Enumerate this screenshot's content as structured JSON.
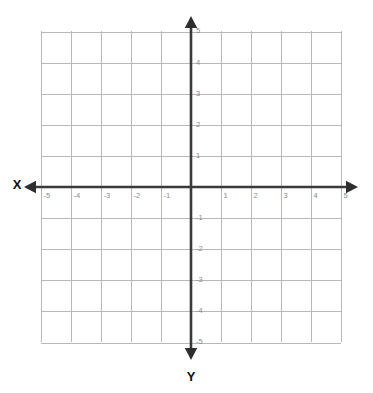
{
  "figure": {
    "kind": "cartesian-coordinate-plane",
    "width": 373,
    "height": 393,
    "background_color": "#ffffff"
  },
  "axis_labels": {
    "x_axis_name": "X",
    "y_axis_name": "Y"
  },
  "colors": {
    "grid": "#b8b8b8",
    "axis": "#3a3a3a",
    "arrow": "#2e2e2e",
    "tick_text": "#8a8a8a",
    "axis_name_text": "#111111"
  },
  "chart_data": {
    "type": "scatter",
    "title": "",
    "subtitle": "",
    "xlabel": "X",
    "ylabel": "Y",
    "xlim": [
      -5,
      5
    ],
    "ylim": [
      -5,
      5
    ],
    "grid": true,
    "grid_step": 1,
    "legend": null,
    "legend_position": "none",
    "origin_label_shown": false,
    "x_ticks": [
      -5,
      -4,
      -3,
      -2,
      -1,
      1,
      2,
      3,
      4,
      5
    ],
    "y_ticks": [
      -5,
      -4,
      -3,
      -2,
      -1,
      1,
      2,
      3,
      4,
      5
    ],
    "x_tick_labels": [
      "-5",
      "-4",
      "-3",
      "-2",
      "-1",
      "1",
      "2",
      "3",
      "4",
      "5"
    ],
    "y_tick_labels": [
      "-5",
      "-4",
      "-3",
      "-2",
      "-1",
      "1",
      "2",
      "3",
      "4",
      "5"
    ],
    "series": [],
    "annotations": []
  },
  "geometry": {
    "origin_x": 191,
    "origin_y": 187,
    "unit_px_x": 30,
    "unit_px_y": 31.1,
    "grid_left": 41,
    "grid_right": 341,
    "grid_top": 31,
    "grid_bottom": 342,
    "axis_x_start": 24,
    "axis_x_end": 358,
    "axis_y_start": 16,
    "axis_y_end": 360,
    "x_name_pos": [
      17,
      186
    ],
    "y_name_pos": [
      191,
      378
    ]
  }
}
